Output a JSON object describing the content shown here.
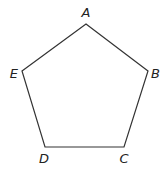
{
  "diagram": {
    "type": "regular-pentagon",
    "stroke_color": "#333333",
    "vertices": [
      {
        "label": "A",
        "x": 86,
        "y": 24,
        "lx": 86,
        "ly": 17,
        "anchor": "middle"
      },
      {
        "label": "B",
        "x": 148,
        "y": 71,
        "lx": 151,
        "ly": 78,
        "anchor": "start"
      },
      {
        "label": "C",
        "x": 124,
        "y": 147,
        "lx": 124,
        "ly": 163,
        "anchor": "middle"
      },
      {
        "label": "D",
        "x": 45,
        "y": 147,
        "lx": 44,
        "ly": 163,
        "anchor": "middle"
      },
      {
        "label": "E",
        "x": 22,
        "y": 71,
        "lx": 18,
        "ly": 78,
        "anchor": "end"
      }
    ]
  }
}
